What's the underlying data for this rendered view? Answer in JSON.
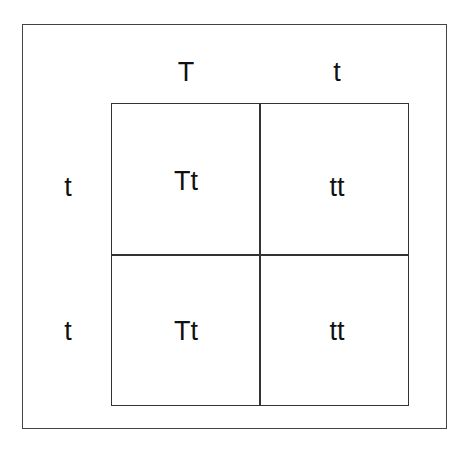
{
  "punnett_square": {
    "column_alleles": [
      "T",
      "t"
    ],
    "row_alleles": [
      "t",
      "t"
    ],
    "cells": [
      [
        "Tt",
        "tt"
      ],
      [
        "Tt",
        "tt"
      ]
    ]
  }
}
